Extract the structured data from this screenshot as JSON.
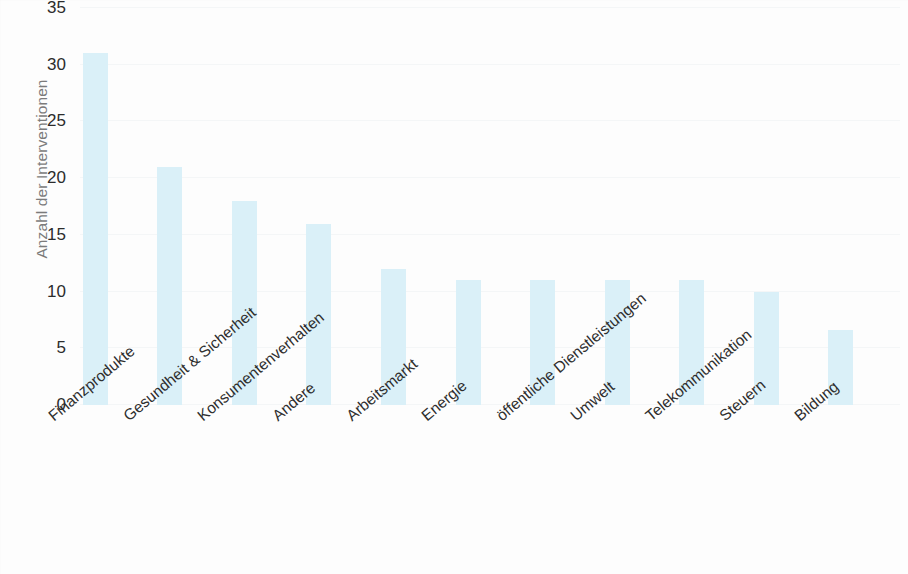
{
  "chart_data": {
    "type": "bar",
    "title": "",
    "xlabel": "",
    "ylabel": "Anzahl der Interventionen",
    "ylim": [
      0,
      35
    ],
    "yticks": [
      0,
      5,
      10,
      15,
      20,
      25,
      30,
      35
    ],
    "ytick_labels": [
      "0",
      "5",
      "10",
      "15",
      "20",
      "25",
      "30",
      "35"
    ],
    "grid": true,
    "legend": null,
    "bar_color": "#daf0f8",
    "text_color": "#2e2e2e",
    "axis_label_color": "#7b7b7b",
    "background_color": "#fdfdfd",
    "categories": [
      "Finanzprodukte",
      "Gesundheit & Sicherheit",
      "Konsumentenverhalten",
      "Andere",
      "Arbeitsmarkt",
      "Energie",
      "öffentliche Dienstleistungen",
      "Umwelt",
      "Telekommunikation",
      "Steuern",
      "Bildung"
    ],
    "values": [
      31,
      21,
      18,
      16,
      12,
      11,
      11,
      11,
      11,
      10,
      6.6
    ]
  }
}
